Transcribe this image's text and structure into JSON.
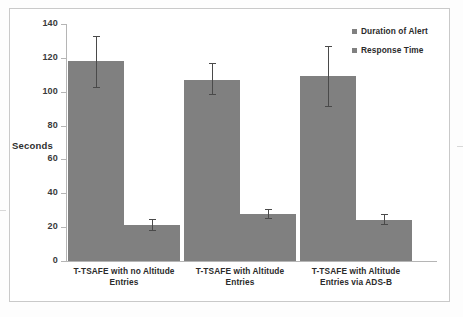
{
  "chart_data": {
    "type": "bar",
    "title": "",
    "xlabel": "",
    "ylabel": "Seconds",
    "ylim": [
      0,
      140
    ],
    "ytick_step": 20,
    "yticks": [
      140,
      120,
      100,
      80,
      60,
      40,
      20,
      0
    ],
    "ytick_labels": [
      "140",
      "120",
      "100",
      "80",
      "60",
      "40",
      "20",
      "0"
    ],
    "grid": false,
    "legend_position": "top-right",
    "bar_color": "#808080",
    "error_bar_color": "#4a4a4a",
    "categories": [
      "T-TSAFE with no Altitude Entries",
      "T-TSAFE with Altitude Entries",
      "T-TSAFE  with Altitude Entries via ADS-B"
    ],
    "category_lines": [
      [
        "T-TSAFE with no Altitude",
        "Entries"
      ],
      [
        "T-TSAFE with Altitude",
        "Entries"
      ],
      [
        "T-TSAFE  with Altitude",
        "Entries via ADS-B"
      ]
    ],
    "series": [
      {
        "name": "Duration of Alert",
        "values": [
          118,
          107,
          109
        ],
        "errors_upper": [
          133,
          117,
          127
        ],
        "errors_lower": [
          102,
          98,
          91
        ]
      },
      {
        "name": "Response Time",
        "values": [
          21,
          28,
          24
        ],
        "errors_upper": [
          25,
          31,
          28
        ],
        "errors_lower": [
          18,
          25,
          21
        ]
      }
    ]
  },
  "legend": {
    "items": [
      {
        "label": "Duration of Alert"
      },
      {
        "label": "Response Time"
      }
    ]
  },
  "axis": {
    "y_title": "Seconds"
  }
}
